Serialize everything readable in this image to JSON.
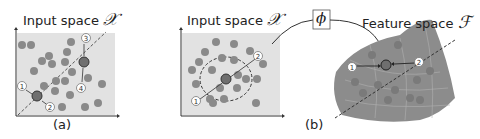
{
  "panel_a": {
    "title": "Input space",
    "symbol": "𝒳",
    "caption": "(a)",
    "markers": [
      "1",
      "2",
      "3",
      "4"
    ]
  },
  "panel_b": {
    "title": "Input space",
    "symbol": "𝒳",
    "caption": "(b)",
    "markers": [
      "1",
      "2"
    ]
  },
  "mapping": {
    "symbol": "ϕ"
  },
  "feature_space": {
    "title": "Feature space",
    "symbol": "ℱ",
    "markers": [
      "1",
      "2"
    ]
  },
  "colors": {
    "background_panel": "#e2e2e2",
    "point": "#8a8a8a",
    "highlight": "#6f6f6f",
    "manifold": "#8c8c8c"
  }
}
